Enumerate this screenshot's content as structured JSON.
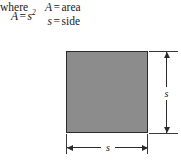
{
  "figure": {
    "kind": "geometry-formula-diagram",
    "shape": "square",
    "formula": {
      "left_side": "A",
      "equals": "=",
      "right_side_base": "s",
      "right_side_exponent": "2",
      "plain_text": "A = s²"
    },
    "where_clause": {
      "keyword": "where",
      "definitions": [
        {
          "symbol": "A",
          "equals": "=",
          "meaning": "area"
        },
        {
          "symbol": "s",
          "equals": "=",
          "meaning": "side"
        }
      ]
    },
    "diagram": {
      "fill_color": "#8c8c8c",
      "stroke_color": "#2b2b2b",
      "background_color": "#ffffff",
      "dimension_labels": {
        "right_side": "s",
        "bottom_side": "s"
      }
    }
  }
}
